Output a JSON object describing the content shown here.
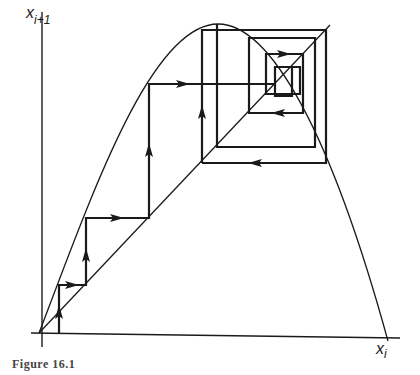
{
  "figure": {
    "type": "cobweb-diagram",
    "y_axis_label": {
      "base": "x",
      "sub": "i+1"
    },
    "x_axis_label": {
      "base": "x",
      "sub": "i"
    },
    "caption_partial": "Figure 16.1",
    "colors": {
      "ink": "#1a1a1a",
      "background": "#ffffff"
    }
  },
  "geometry": {
    "origin": [
      39,
      333
    ],
    "x_axis_end": [
      400,
      338
    ],
    "y_axis_top": [
      42,
      12
    ],
    "map_curve": "M39,333 C90,200 150,24 218,24 C270,24 330,130 388,341",
    "identity_line": [
      [
        39,
        333
      ],
      [
        330,
        25
      ]
    ],
    "cobweb_path": "M59,333 L59,285 L86,285 L86,218 L149,218 L149,84 L275,84 L275,95 M202,163 L202,30 L326,30 L326,163 L202,163 M217,24 L217,147 L315,147 L315,38 L249,38 L249,113 L303,113 L303,54 L266,54 L266,94 L300,94 L300,67 L275,67 L275,96 L292,96 L292,67",
    "arrows": [
      {
        "x": 59,
        "y": 312,
        "dir": "up"
      },
      {
        "x": 72,
        "y": 285,
        "dir": "right"
      },
      {
        "x": 86,
        "y": 255,
        "dir": "up"
      },
      {
        "x": 117,
        "y": 218,
        "dir": "right"
      },
      {
        "x": 149,
        "y": 150,
        "dir": "up"
      },
      {
        "x": 183,
        "y": 84,
        "dir": "right"
      },
      {
        "x": 202,
        "y": 112,
        "dir": "up"
      },
      {
        "x": 284,
        "y": 54,
        "dir": "right"
      },
      {
        "x": 278,
        "y": 113,
        "dir": "left"
      },
      {
        "x": 255,
        "y": 163,
        "dir": "left"
      }
    ]
  }
}
